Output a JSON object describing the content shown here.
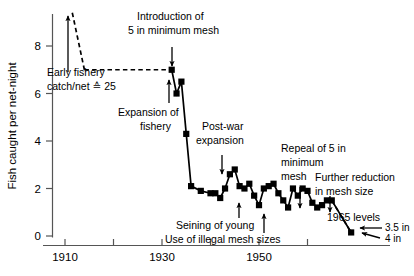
{
  "chart_data": {
    "type": "line",
    "title": "",
    "xlabel": "",
    "ylabel": "Fish caught per net-night",
    "xlim": [
      1905,
      1970
    ],
    "ylim": [
      0,
      9.2
    ],
    "grid": false,
    "legend": "none",
    "x_ticks": [
      1910,
      1920,
      1930,
      1940,
      1950,
      1960
    ],
    "x_tick_labels": [
      "1910",
      "",
      "1930",
      "",
      "1950",
      ""
    ],
    "y_ticks": [
      0,
      2,
      4,
      6,
      8
    ],
    "y_tick_labels": [
      "0",
      "2",
      "4",
      "6",
      "8"
    ],
    "series": [
      {
        "name": "Fish caught per net-night",
        "style": "solid-with-square-markers",
        "x": [
          1932,
          1933,
          1934,
          1935,
          1936,
          1938,
          1940,
          1941,
          1942,
          1943,
          1944,
          1945,
          1946,
          1947,
          1948,
          1949,
          1950,
          1951,
          1952,
          1953,
          1954,
          1955,
          1956,
          1957,
          1958,
          1959,
          1960,
          1961,
          1962,
          1963,
          1964,
          1965,
          1969
        ],
        "y": [
          7.0,
          6.0,
          6.5,
          4.3,
          2.1,
          1.9,
          1.8,
          1.8,
          1.6,
          2.0,
          2.6,
          2.8,
          2.1,
          2.0,
          2.2,
          1.7,
          1.3,
          2.0,
          2.1,
          2.2,
          1.8,
          1.5,
          1.2,
          2.0,
          1.7,
          2.0,
          1.9,
          1.4,
          1.2,
          1.3,
          1.5,
          1.5,
          0.15
        ]
      },
      {
        "name": "Early fishery reference segment",
        "style": "dashed",
        "x": [
          1914,
          1932
        ],
        "y": [
          7.0,
          7.0
        ]
      },
      {
        "name": "Pre-1914 rise (off scale)",
        "style": "dashed",
        "x": [
          1911.5,
          1914
        ],
        "y": [
          9.4,
          7.0
        ]
      },
      {
        "name": "Decline to 1965 levels",
        "style": "dashed",
        "x": [
          1965,
          1969
        ],
        "y": [
          1.5,
          0.15
        ]
      }
    ],
    "annotations": [
      {
        "id": "early-fishery",
        "text_lines": [
          "Early fishery",
          "catch/net ≙ 25"
        ],
        "x": 1910,
        "y": 7.1
      },
      {
        "id": "introduction-mesh",
        "text_lines": [
          "Introduction of",
          "5 in minimum mesh"
        ],
        "x": 1932,
        "y": 9.0
      },
      {
        "id": "expansion-fishery",
        "text_lines": [
          "Expansion of",
          "fishery"
        ],
        "x": 1930,
        "y": 5.3
      },
      {
        "id": "post-war-expansion",
        "text_lines": [
          "Post-war",
          "expansion"
        ],
        "x": 1944,
        "y": 4.0
      },
      {
        "id": "seining-young",
        "text_lines": [
          "Seining of young"
        ],
        "x": 1949,
        "y": 0.95
      },
      {
        "id": "illegal-mesh",
        "text_lines": [
          "Use of illegal mesh sizes"
        ],
        "x": 1951,
        "y": 0.45
      },
      {
        "id": "repeal-mesh",
        "text_lines": [
          "Repeal of 5 in",
          "minimum",
          "mesh"
        ],
        "x": 1957,
        "y": 3.6
      },
      {
        "id": "further-reduction",
        "text_lines": [
          "Further reduction",
          "in mesh size"
        ],
        "x": 1963,
        "y": 2.6
      },
      {
        "id": "levels-1965",
        "text_lines": [
          "1965 levels"
        ],
        "x": 1964,
        "y": 1.1
      },
      {
        "id": "mesh-3-5in",
        "text_lines": [
          "3.5 in"
        ],
        "x": 1968,
        "y": 0.75
      },
      {
        "id": "mesh-4in",
        "text_lines": [
          "4 in"
        ],
        "x": 1968,
        "y": 0.35
      }
    ]
  },
  "axes": {
    "y_title": "Fish caught per net-night",
    "y_labels": [
      "8",
      "6",
      "4",
      "2",
      "0"
    ],
    "x_labels": [
      "1910",
      "1930",
      "1950"
    ]
  },
  "labels": {
    "early_fishery_line1": "Early fishery",
    "early_fishery_line2": "catch/net ≙ 25",
    "introduction_line1": "Introduction of",
    "introduction_line2": "5 in minimum mesh",
    "expansion_line1": "Expansion of",
    "expansion_line2": "fishery",
    "postwar_line1": "Post-war",
    "postwar_line2": "expansion",
    "seining": "Seining of young",
    "illegal_mesh": "Use of illegal mesh sizes",
    "repeal_line1": "Repeal of 5 in",
    "repeal_line2": "minimum",
    "repeal_line3": "mesh",
    "further_line1": "Further reduction",
    "further_line2": "in mesh size",
    "levels_1965": "1965 levels",
    "mesh_35": "3.5 in",
    "mesh_4": "4 in"
  }
}
